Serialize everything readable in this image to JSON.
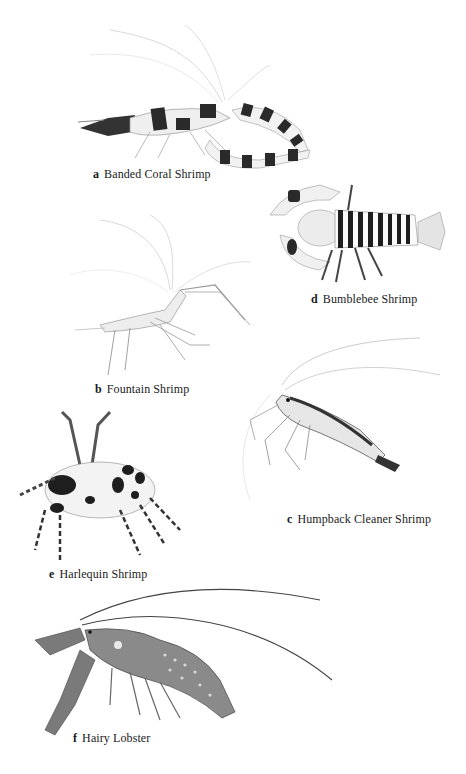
{
  "page": {
    "background": "#ffffff",
    "ink_color": "#1a1a1a"
  },
  "specimens": [
    {
      "letter": "a",
      "name": "Banded Coral Shrimp"
    },
    {
      "letter": "d",
      "name": "Bumblebee Shrimp"
    },
    {
      "letter": "b",
      "name": "Fountain Shrimp"
    },
    {
      "letter": "c",
      "name": "Humpback Cleaner Shrimp"
    },
    {
      "letter": "e",
      "name": "Harlequin Shrimp"
    },
    {
      "letter": "f",
      "name": "Hairy Lobster"
    }
  ]
}
